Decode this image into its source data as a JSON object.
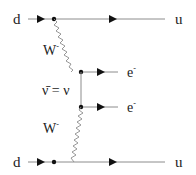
{
  "diagram": {
    "type": "feynman-diagram",
    "process": "neutrinoless double beta decay",
    "particles": {
      "top_in": "d",
      "top_out": "u",
      "bottom_in": "d",
      "bottom_out": "u",
      "top_boson": "W",
      "top_boson_charge": "-",
      "bottom_boson": "W",
      "bottom_boson_charge": "-",
      "electron_top": "e",
      "electron_top_charge": "-",
      "electron_bottom": "e",
      "electron_bottom_charge": "-",
      "neutrino_label": "ν̄ = ν"
    },
    "colors": {
      "line": "#8c8c8c",
      "arrow": "#111111",
      "vertex": "#111111",
      "text": "#222222"
    }
  }
}
